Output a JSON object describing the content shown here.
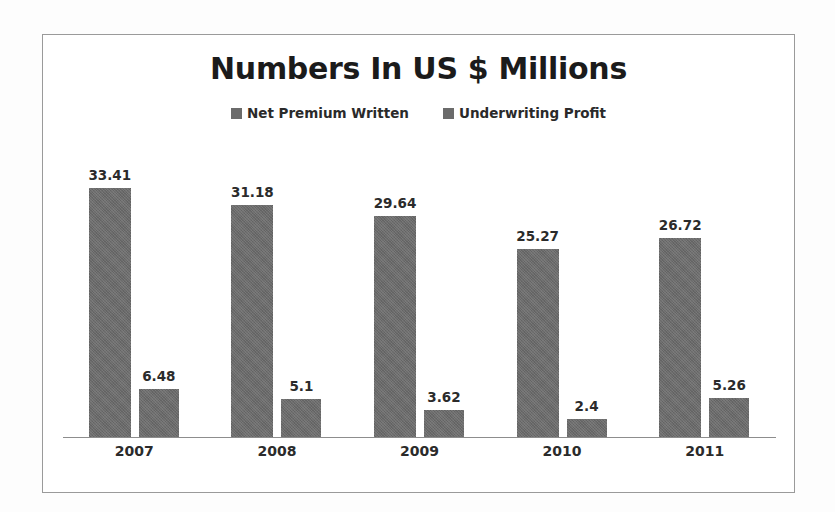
{
  "chart_data": {
    "type": "bar",
    "title": "Numbers In US $ Millions",
    "xlabel": "",
    "ylabel": "",
    "categories": [
      "2007",
      "2008",
      "2009",
      "2010",
      "2011"
    ],
    "series": [
      {
        "name": "Net Premium Written",
        "values": [
          33.41,
          31.18,
          29.64,
          25.27,
          26.72
        ],
        "labels": [
          "33.41",
          "31.18",
          "29.64",
          "25.27",
          "26.72"
        ],
        "color": "#6b6b6b"
      },
      {
        "name": "Underwriting Profit",
        "values": [
          6.48,
          5.1,
          3.62,
          2.4,
          5.26
        ],
        "labels": [
          "6.48",
          "5.1",
          "3.62",
          "2.4",
          "5.26"
        ],
        "color": "#6b6b6b"
      }
    ],
    "ylim": [
      0,
      38
    ],
    "grid": false,
    "legend_position": "top-center",
    "axis_color": "#8d8d8d",
    "frame_color": "#9a9a9a"
  },
  "legend": {
    "items": [
      {
        "label": "Net Premium Written"
      },
      {
        "label": "Underwriting Profit"
      }
    ]
  }
}
